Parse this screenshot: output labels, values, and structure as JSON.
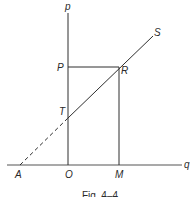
{
  "figure": {
    "caption": "Fig. 4–4",
    "axes": {
      "vertical_label": "p",
      "horizontal_label": "q"
    },
    "points": {
      "P": "P",
      "R": "R",
      "S": "S",
      "T": "T",
      "A": "A",
      "O": "O",
      "M": "M"
    },
    "colors": {
      "line": "#2e2e2e",
      "axis": "#555555",
      "background": "#ffffff"
    }
  }
}
